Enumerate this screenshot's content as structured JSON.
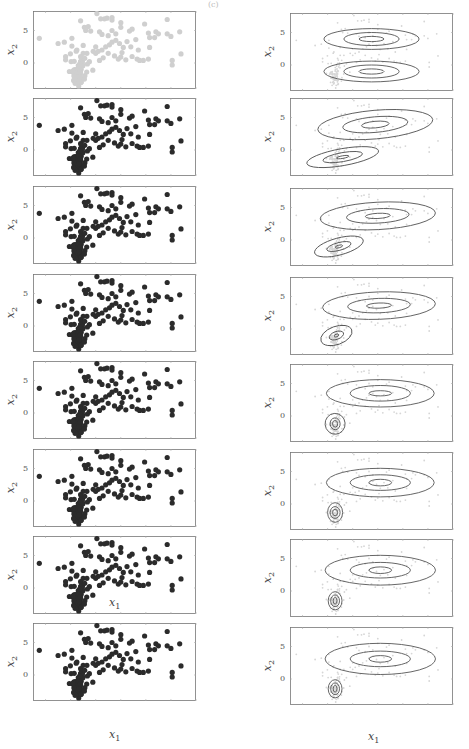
{
  "figure": {
    "top_label": "(c)",
    "x_axis_label": "x",
    "x_axis_sub": "1",
    "y_axis_label": "x",
    "y_axis_sub": "2",
    "y_ticks": [
      "5",
      "0"
    ]
  },
  "colors": {
    "initial_points": "#cfcfcf",
    "assigned_points": "#2b2b2b",
    "contour": "#555555",
    "faint_points": "#d6d6d6",
    "axes": "#777777"
  },
  "chart_data": {
    "type": "scatter",
    "xlabel": "x1",
    "ylabel": "x2",
    "ylim": [
      -4,
      8
    ],
    "xlim": [
      -3,
      10
    ],
    "y_ticks": [
      0,
      5
    ],
    "grid": false,
    "legend": "none",
    "rows": 8,
    "columns": [
      "responsibilities",
      "gaussian_contours"
    ],
    "points": [
      [
        -2.5,
        3.8
      ],
      [
        -1.0,
        3.0
      ],
      [
        -0.5,
        3.2
      ],
      [
        0.1,
        3.8
      ],
      [
        0.1,
        2.6
      ],
      [
        -0.4,
        1.0
      ],
      [
        -0.4,
        0.5
      ],
      [
        -0.1,
        -1.3
      ],
      [
        0.5,
        2.0
      ],
      [
        0.8,
        6.5
      ],
      [
        1.1,
        5.5
      ],
      [
        1.2,
        5.0
      ],
      [
        1.4,
        5.6
      ],
      [
        1.6,
        4.9
      ],
      [
        1.0,
        2.7
      ],
      [
        1.0,
        1.5
      ],
      [
        1.3,
        1.5
      ],
      [
        0.8,
        1.0
      ],
      [
        1.8,
        1.8
      ],
      [
        2.0,
        1.5
      ],
      [
        2.2,
        1.8
      ],
      [
        2.1,
        7.6
      ],
      [
        2.4,
        6.8
      ],
      [
        2.7,
        6.8
      ],
      [
        2.9,
        6.9
      ],
      [
        3.3,
        7.0
      ],
      [
        3.3,
        6.6
      ],
      [
        2.3,
        4.8
      ],
      [
        2.5,
        4.4
      ],
      [
        3.0,
        4.2
      ],
      [
        3.3,
        5.0
      ],
      [
        3.6,
        4.5
      ],
      [
        2.5,
        2.0
      ],
      [
        2.8,
        2.5
      ],
      [
        3.1,
        2.8
      ],
      [
        3.3,
        3.2
      ],
      [
        3.6,
        3.5
      ],
      [
        3.0,
        1.5
      ],
      [
        2.6,
        0.8
      ],
      [
        2.3,
        0.4
      ],
      [
        3.5,
        1.1
      ],
      [
        3.8,
        0.6
      ],
      [
        4.0,
        0.9
      ],
      [
        4.1,
        1.6
      ],
      [
        4.2,
        2.4
      ],
      [
        4.0,
        5.5
      ],
      [
        4.0,
        6.2
      ],
      [
        4.5,
        3.3
      ],
      [
        4.8,
        2.5
      ],
      [
        4.7,
        4.9
      ],
      [
        4.9,
        5.2
      ],
      [
        5.2,
        3.6
      ],
      [
        5.4,
        2.0
      ],
      [
        5.3,
        0.6
      ],
      [
        5.5,
        0.4
      ],
      [
        5.8,
        0.4
      ],
      [
        5.9,
        6.0
      ],
      [
        6.2,
        4.6
      ],
      [
        6.3,
        3.9
      ],
      [
        6.3,
        2.4
      ],
      [
        6.2,
        0.6
      ],
      [
        6.8,
        4.8
      ],
      [
        6.7,
        3.9
      ],
      [
        7.0,
        4.5
      ],
      [
        7.7,
        6.7
      ],
      [
        7.7,
        4.5
      ],
      [
        8.0,
        4.1
      ],
      [
        8.1,
        0.4
      ],
      [
        8.1,
        -0.3
      ],
      [
        8.7,
        4.8
      ],
      [
        8.8,
        1.4
      ],
      [
        4.9,
        1.0
      ],
      [
        3.9,
        3.0
      ],
      [
        2.0,
        2.5
      ],
      [
        1.5,
        0.2
      ],
      [
        4.4,
        0.5
      ]
    ],
    "cluster_points": "approximately 80 points tightly distributed around (0.6, -1.5) with spread sx~0.3, sy~1.1",
    "rows_detail": [
      {
        "iteration": 1,
        "contours": [
          {
            "center": [
              3.5,
              4.0
            ],
            "rx_scale": [
              1.0,
              2.2,
              3.8
            ],
            "ry_scale": [
              0.4,
              1.0,
              1.6
            ],
            "angle": 0
          },
          {
            "center": [
              3.5,
              -1.0
            ],
            "rx_scale": [
              1.0,
              2.2,
              3.8
            ],
            "ry_scale": [
              0.4,
              1.0,
              1.6
            ],
            "angle": 0
          }
        ]
      },
      {
        "iteration": 2,
        "contours": [
          {
            "center": [
              3.8,
              3.9
            ],
            "rx_scale": [
              1.1,
              2.6,
              4.6
            ],
            "ry_scale": [
              0.5,
              1.2,
              2.2
            ],
            "angle": -5
          },
          {
            "center": [
              1.2,
              -1.1
            ],
            "rx_scale": [
              0.5,
              1.6,
              2.9
            ],
            "ry_scale": [
              0.2,
              0.7,
              1.3
            ],
            "angle": -10
          }
        ]
      },
      {
        "iteration": 3,
        "contours": [
          {
            "center": [
              4.0,
              3.7
            ],
            "rx_scale": [
              1.0,
              2.5,
              4.6
            ],
            "ry_scale": [
              0.4,
              1.1,
              2.1
            ],
            "angle": -3
          },
          {
            "center": [
              0.9,
              -1.0
            ],
            "rx_scale": [
              0.3,
              1.0,
              2.0
            ],
            "ry_scale": [
              0.2,
              0.6,
              1.3
            ],
            "angle": -15
          }
        ]
      },
      {
        "iteration": 4,
        "contours": [
          {
            "center": [
              4.1,
              3.6
            ],
            "rx_scale": [
              1.0,
              2.5,
              4.5
            ],
            "ry_scale": [
              0.4,
              1.1,
              2.1
            ],
            "angle": -2
          },
          {
            "center": [
              0.7,
              -1.0
            ],
            "rx_scale": [
              0.2,
              0.6,
              1.3
            ],
            "ry_scale": [
              0.2,
              0.6,
              1.4
            ],
            "angle": -20
          }
        ]
      },
      {
        "iteration": 5,
        "contours": [
          {
            "center": [
              4.2,
              3.5
            ],
            "rx_scale": [
              0.9,
              2.4,
              4.3
            ],
            "ry_scale": [
              0.4,
              1.2,
              2.1
            ],
            "angle": 0
          },
          {
            "center": [
              0.6,
              -1.2
            ],
            "rx_scale": [
              0.2,
              0.4,
              0.8
            ],
            "ry_scale": [
              0.5,
              0.9,
              1.6
            ],
            "angle": -5
          }
        ]
      },
      {
        "iteration": 6,
        "contours": [
          {
            "center": [
              4.2,
              3.3
            ],
            "rx_scale": [
              0.9,
              2.4,
              4.3
            ],
            "ry_scale": [
              0.5,
              1.2,
              2.2
            ],
            "angle": 0
          },
          {
            "center": [
              0.6,
              -1.3
            ],
            "rx_scale": [
              0.2,
              0.4,
              0.6
            ],
            "ry_scale": [
              0.5,
              0.9,
              1.5
            ],
            "angle": 0
          }
        ]
      },
      {
        "iteration": 7,
        "contours": [
          {
            "center": [
              4.2,
              3.2
            ],
            "rx_scale": [
              0.9,
              2.4,
              4.4
            ],
            "ry_scale": [
              0.5,
              1.2,
              2.3
            ],
            "angle": 0
          },
          {
            "center": [
              0.6,
              -1.5
            ],
            "rx_scale": [
              0.15,
              0.35,
              0.55
            ],
            "ry_scale": [
              0.5,
              0.9,
              1.4
            ],
            "angle": 0
          }
        ]
      },
      {
        "iteration": 8,
        "contours": [
          {
            "center": [
              4.2,
              3.1
            ],
            "rx_scale": [
              0.9,
              2.4,
              4.4
            ],
            "ry_scale": [
              0.5,
              1.2,
              2.4
            ],
            "angle": 0
          },
          {
            "center": [
              0.6,
              -1.5
            ],
            "rx_scale": [
              0.15,
              0.35,
              0.55
            ],
            "ry_scale": [
              0.5,
              0.9,
              1.4
            ],
            "angle": 0
          }
        ]
      }
    ]
  }
}
